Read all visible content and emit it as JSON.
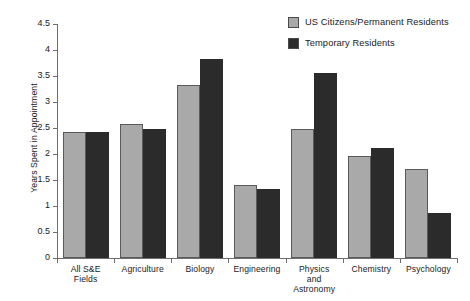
{
  "chart_data": {
    "type": "bar",
    "title": "",
    "xlabel": "",
    "ylabel": "Years Spent in Appointment",
    "ylim": [
      0,
      4.5
    ],
    "ytick_labels": [
      "0",
      "0.5",
      "1",
      "1.5",
      "2",
      "2.5",
      "3",
      "3.5",
      "4",
      "4.5"
    ],
    "ytick_values": [
      0,
      0.5,
      1,
      1.5,
      2,
      2.5,
      3,
      3.5,
      4,
      4.5
    ],
    "grid": false,
    "legend_position": "top-right",
    "categories": [
      "All S&E Fields",
      "Agriculture",
      "Biology",
      "Engineering",
      "Physics and Astronomy",
      "Chemistry",
      "Psychology"
    ],
    "category_lines": [
      [
        "All S&E",
        "Fields"
      ],
      [
        "Agriculture"
      ],
      [
        "Biology"
      ],
      [
        "Engineering"
      ],
      [
        "Physics",
        "and",
        "Astronomy"
      ],
      [
        "Chemistry"
      ],
      [
        "Psychology"
      ]
    ],
    "series": [
      {
        "name": "US Citizens/Permanent Residents",
        "color": "#a9a9a9",
        "values": [
          2.42,
          2.58,
          3.33,
          1.41,
          2.48,
          1.97,
          1.72
        ]
      },
      {
        "name": "Temporary Residents",
        "color": "#2b2b2b",
        "values": [
          2.42,
          2.49,
          3.82,
          1.32,
          3.55,
          2.12,
          0.87
        ]
      }
    ]
  }
}
